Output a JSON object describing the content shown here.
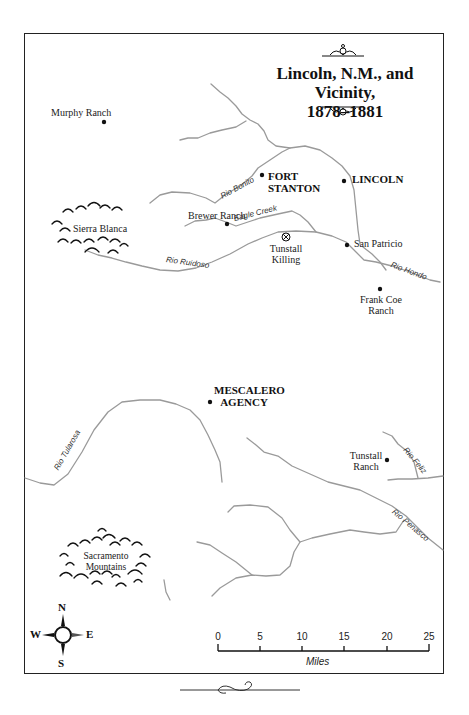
{
  "map": {
    "title_line1": "Lincoln, N.M., and Vicinity,",
    "title_line2": "1878–1881",
    "places": {
      "murphy_ranch": "Murphy Ranch",
      "fort_stanton_1": "FORT",
      "fort_stanton_2": "STANTON",
      "lincoln": "LINCOLN",
      "sierra_blanca": "Sierra Blanca",
      "brewer_ranch": "Brewer Ranch",
      "tunstall_killing_1": "Tunstall",
      "tunstall_killing_2": "Killing",
      "san_patricio": "San Patricio",
      "frank_coe_ranch_1": "Frank Coe",
      "frank_coe_ranch_2": "Ranch",
      "mescalero_agency_1": "MESCALERO",
      "mescalero_agency_2": "AGENCY",
      "tunstall_ranch_1": "Tunstall",
      "tunstall_ranch_2": "Ranch",
      "sacramento_mountains_1": "Sacramento",
      "sacramento_mountains_2": "Mountains"
    },
    "rivers": {
      "rio_bonito": "Rio Bonito",
      "eagle_creek": "Eagle Creek",
      "rio_ruidoso": "Rio Ruidoso",
      "rio_hondo": "Rio Hondo",
      "rio_tularosa": "Rio Tularosa",
      "rio_feliz": "Rio Feliz",
      "rio_penasco": "Rio Penasco"
    },
    "compass": {
      "n": "N",
      "s": "S",
      "e": "E",
      "w": "W"
    },
    "scale": {
      "ticks": [
        "0",
        "5",
        "10",
        "15",
        "20",
        "25"
      ],
      "unit": "Miles"
    },
    "colors": {
      "river": "#9a9a9a",
      "ink": "#111111",
      "frame": "#222222"
    }
  }
}
